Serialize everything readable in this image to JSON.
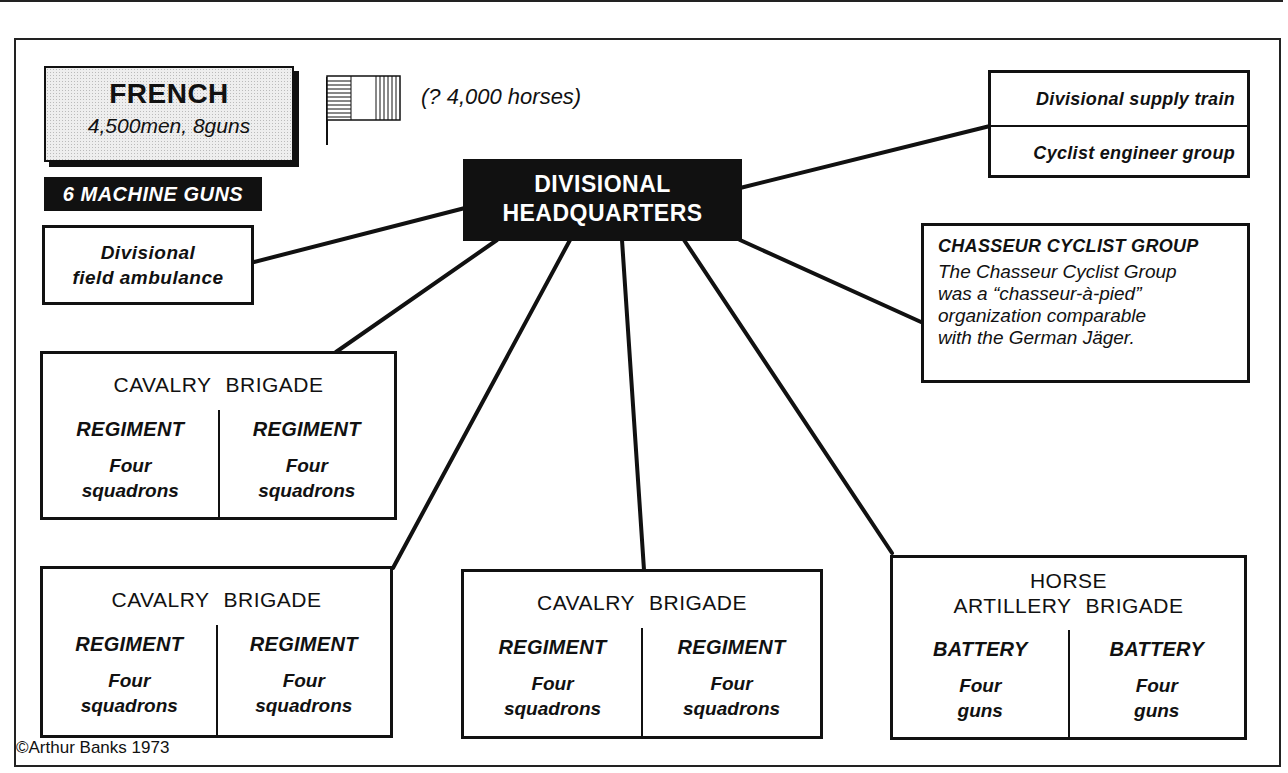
{
  "diagram": {
    "title_box": {
      "heading": "FRENCH",
      "subheading": "4,500men, 8guns"
    },
    "machine_guns": "6 MACHINE GUNS",
    "flag": {
      "icon": "french-tricolour-flag-icon",
      "caption": "(? 4,000 horses)"
    },
    "headquarters": {
      "line1": "DIVISIONAL",
      "line2": "HEADQUARTERS"
    },
    "field_ambulance": {
      "line1": "Divisional",
      "line2": "field ambulance"
    },
    "support_units": [
      "Divisional supply train",
      "Cyclist engineer group"
    ],
    "chasseur": {
      "heading": "CHASSEUR CYCLIST GROUP",
      "lines": [
        "The Chasseur Cyclist Group",
        "was a “chasseur-à-pied”",
        "organization  comparable",
        "with the German Jäger."
      ]
    },
    "brigades": [
      {
        "title": "CAVALRY BRIGADE",
        "units": [
          {
            "name": "REGIMENT",
            "line1": "Four",
            "line2": "squadrons"
          },
          {
            "name": "REGIMENT",
            "line1": "Four",
            "line2": "squadrons"
          }
        ]
      },
      {
        "title": "CAVALRY BRIGADE",
        "units": [
          {
            "name": "REGIMENT",
            "line1": "Four",
            "line2": "squadrons"
          },
          {
            "name": "REGIMENT",
            "line1": "Four",
            "line2": "squadrons"
          }
        ]
      },
      {
        "title": "CAVALRY BRIGADE",
        "units": [
          {
            "name": "REGIMENT",
            "line1": "Four",
            "line2": "squadrons"
          },
          {
            "name": "REGIMENT",
            "line1": "Four",
            "line2": "squadrons"
          }
        ]
      },
      {
        "title_line1": "HORSE",
        "title_line2": "ARTILLERY BRIGADE",
        "units": [
          {
            "name": "BATTERY",
            "line1": "Four",
            "line2": "guns"
          },
          {
            "name": "BATTERY",
            "line1": "Four",
            "line2": "guns"
          }
        ]
      }
    ],
    "copyright": "©Arthur Banks 1973",
    "colors": {
      "ink": "#111111",
      "paper": "#ffffff",
      "tint": "#eeeeee"
    }
  }
}
